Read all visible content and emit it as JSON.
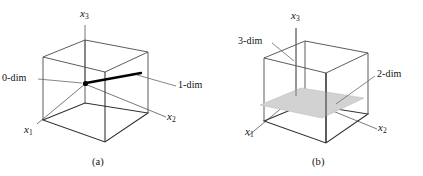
{
  "figure": {
    "background_color": "#ffffff",
    "ink_color": "#1a1a1a",
    "wire_color": "#4a4a4a",
    "accent_color": "#000000",
    "plane_fill_color": "#d2d2d2",
    "panels": [
      {
        "id": "a",
        "caption": "(a)",
        "axes": [
          {
            "name": "x3",
            "label_main": "x",
            "label_sub": "3"
          },
          {
            "name": "x1",
            "label_main": "x",
            "label_sub": "1"
          },
          {
            "name": "x2",
            "label_main": "x",
            "label_sub": "2"
          }
        ],
        "annotations": [
          {
            "name": "zero-dim",
            "label": "0-dim"
          },
          {
            "name": "one-dim",
            "label": "1-dim"
          }
        ]
      },
      {
        "id": "b",
        "caption": "(b)",
        "axes": [
          {
            "name": "x3",
            "label_main": "x",
            "label_sub": "3"
          },
          {
            "name": "x1",
            "label_main": "x",
            "label_sub": "1"
          },
          {
            "name": "x2",
            "label_main": "x",
            "label_sub": "2"
          }
        ],
        "annotations": [
          {
            "name": "three-dim",
            "label": "3-dim"
          },
          {
            "name": "two-dim",
            "label": "2-dim"
          }
        ]
      }
    ]
  }
}
